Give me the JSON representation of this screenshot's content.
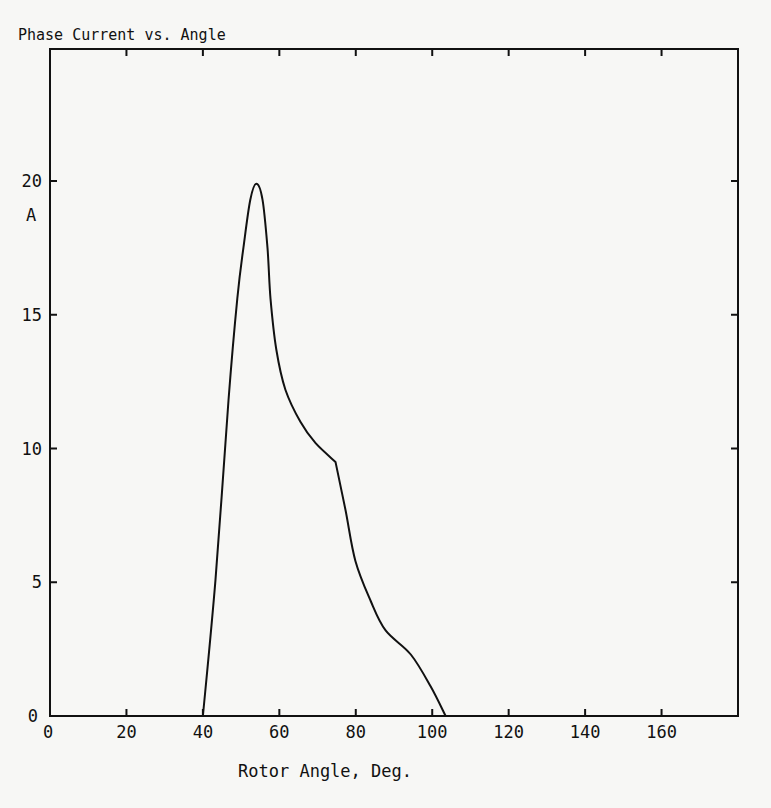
{
  "chart_data": {
    "type": "line",
    "title": "Phase Current vs. Angle",
    "xlabel": "Rotor Angle, Deg.",
    "ylabel": "A",
    "xlim": [
      0,
      180
    ],
    "ylim": [
      0,
      24.8
    ],
    "grid": false,
    "legend": null,
    "x_ticks": [
      0,
      20,
      40,
      60,
      80,
      100,
      120,
      140,
      160
    ],
    "x_tick_labels": [
      "0",
      "20",
      "40",
      "60",
      "80",
      "100",
      "120",
      "140",
      "160"
    ],
    "y_ticks": [
      0,
      5,
      10,
      15,
      20
    ],
    "y_tick_labels": [
      "0",
      "5",
      "10",
      "15",
      "20"
    ],
    "series": [
      {
        "name": "Phase Current",
        "x": [
          40,
          43.3,
          46.7,
          49,
          50.6,
          52.4,
          54,
          55.6,
          56.9,
          57.7,
          59.2,
          61.6,
          65.5,
          69.5,
          74.7,
          77.3,
          79.9,
          83.9,
          87.8,
          94.4,
          99.6,
          103.5
        ],
        "y": [
          0,
          5.1,
          11.8,
          15.6,
          17.5,
          19.3,
          19.9,
          19.3,
          17.5,
          15.6,
          13.7,
          12.2,
          11.0,
          10.2,
          9.5,
          7.7,
          5.8,
          4.3,
          3.2,
          2.3,
          1.1,
          0
        ]
      }
    ]
  }
}
